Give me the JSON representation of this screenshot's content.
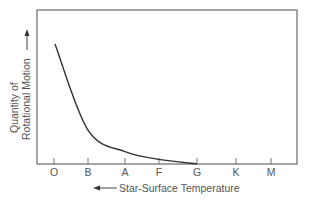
{
  "chart_data": {
    "type": "line",
    "title": "",
    "xlabel": "Star-Surface Temperature",
    "xlabel_arrow": "left",
    "ylabel": [
      "Quantity of",
      "Rotational Motion"
    ],
    "ylabel_arrow": "up",
    "categories": [
      "O",
      "B",
      "A",
      "F",
      "G",
      "K",
      "M"
    ],
    "series": [
      {
        "name": "Rotational motion",
        "values": [
          0.78,
          0.22,
          0.08,
          0.03,
          0.0,
          null,
          null
        ]
      }
    ],
    "y_ticks": [],
    "grid": false,
    "legend": null
  },
  "layout": {
    "frame": {
      "left": 37,
      "top": 10,
      "right": 297,
      "bottom": 164
    },
    "tick_x": [
      54,
      88,
      125,
      159,
      197,
      236,
      271
    ],
    "curve_color": "#333333",
    "frame_color": "#6a6a6a"
  }
}
